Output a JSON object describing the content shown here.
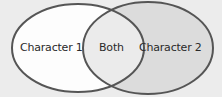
{
  "diagram": {
    "type": "venn",
    "sets": [
      {
        "id": "left",
        "label": "Character 1",
        "fill": "#fdfdfd"
      },
      {
        "id": "right",
        "label": "Character 2",
        "fill": "#dcdcdc"
      }
    ],
    "intersection": {
      "label": "Both",
      "fill": "#ebebeb"
    },
    "stroke": "#555555",
    "background": "#ececec"
  }
}
